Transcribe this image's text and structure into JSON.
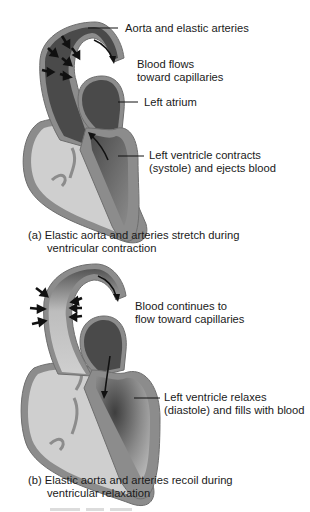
{
  "colors": {
    "wall": "#8c8c8c",
    "wall_edge": "#6e6e6e",
    "dark_blood": "#4a4a4a",
    "medium_blood": "#7a7a7a",
    "light_chamber": "#cfcfcf",
    "arrow": "#111111",
    "text": "#1a1a1a"
  },
  "panel_a": {
    "labels": {
      "aorta": "Aorta and elastic arteries",
      "blood_flows_1": "Blood flows",
      "blood_flows_2": "toward capillaries",
      "left_atrium": "Left atrium",
      "lv_1": "Left ventricle contracts",
      "lv_2": "(systole) and ejects blood"
    },
    "caption": {
      "line1": "(a) Elastic aorta and arteries stretch during",
      "line2": "ventricular contraction"
    }
  },
  "panel_b": {
    "labels": {
      "blood_continues_1": "Blood continues to",
      "blood_continues_2": "flow toward capillaries",
      "lv_1": "Left ventricle relaxes",
      "lv_2": "(diastole) and fills with blood"
    },
    "caption": {
      "line1": "(b) Elastic aorta and arteries recoil during",
      "line2": "ventricular relaxation"
    }
  }
}
